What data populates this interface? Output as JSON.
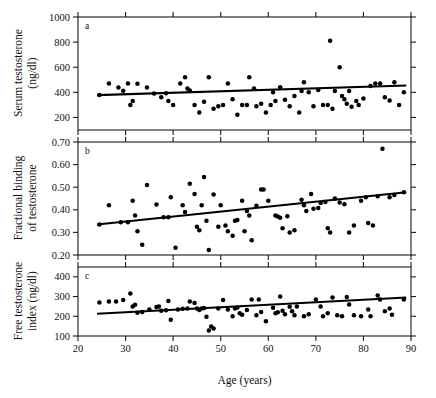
{
  "figure": {
    "xlabel": "Age (years)",
    "panel_letters": [
      "a",
      "b",
      "c"
    ]
  },
  "chart_data": [
    {
      "type": "scatter",
      "panel": "a",
      "title": "",
      "xlabel": "Age (years)",
      "ylabel": "Serum testosterone (ng/dl)",
      "ylabel_lines": [
        "Serum testosterone",
        "(ng/dl)"
      ],
      "xlim": [
        20,
        90
      ],
      "ylim": [
        100,
        1000
      ],
      "xticks": [
        20,
        30,
        40,
        50,
        60,
        70,
        80,
        90
      ],
      "xticklabels": [
        "20",
        "30",
        "40",
        "50",
        "60",
        "70",
        "80",
        "90"
      ],
      "yticks": [
        200,
        400,
        600,
        800,
        1000
      ],
      "yticklabels": [
        "200",
        "400",
        "600",
        "800",
        "1000"
      ],
      "grid": false,
      "legend": "none",
      "fit_line": {
        "x": [
          24,
          89
        ],
        "y": [
          378,
          455
        ]
      },
      "points": [
        [
          24.5,
          378
        ],
        [
          26.5,
          470
        ],
        [
          28.5,
          438
        ],
        [
          29.5,
          412
        ],
        [
          30.5,
          470
        ],
        [
          31.0,
          300
        ],
        [
          31.5,
          330
        ],
        [
          32.5,
          468
        ],
        [
          34.5,
          438
        ],
        [
          36.0,
          390
        ],
        [
          37.5,
          360
        ],
        [
          38.5,
          392
        ],
        [
          39.0,
          330
        ],
        [
          40.0,
          300
        ],
        [
          41.5,
          470
        ],
        [
          42.5,
          520
        ],
        [
          43.0,
          430
        ],
        [
          43.5,
          415
        ],
        [
          44.5,
          300
        ],
        [
          45.5,
          240
        ],
        [
          46.5,
          325
        ],
        [
          47.5,
          520
        ],
        [
          48.5,
          270
        ],
        [
          49.5,
          290
        ],
        [
          50.5,
          300
        ],
        [
          51.5,
          470
        ],
        [
          52.5,
          345
        ],
        [
          53.5,
          222
        ],
        [
          54.5,
          300
        ],
        [
          55.5,
          300
        ],
        [
          56.0,
          520
        ],
        [
          57.0,
          430
        ],
        [
          57.5,
          290
        ],
        [
          58.5,
          310
        ],
        [
          59.5,
          240
        ],
        [
          60.5,
          300
        ],
        [
          61.0,
          400
        ],
        [
          61.5,
          330
        ],
        [
          62.5,
          440
        ],
        [
          63.5,
          340
        ],
        [
          64.5,
          290
        ],
        [
          65.5,
          370
        ],
        [
          66.5,
          240
        ],
        [
          67.0,
          410
        ],
        [
          67.5,
          480
        ],
        [
          68.5,
          400
        ],
        [
          69.5,
          290
        ],
        [
          70.5,
          418
        ],
        [
          71.5,
          300
        ],
        [
          72.5,
          300
        ],
        [
          73.0,
          810
        ],
        [
          73.5,
          270
        ],
        [
          74.0,
          410
        ],
        [
          75.0,
          600
        ],
        [
          75.5,
          370
        ],
        [
          76.0,
          345
        ],
        [
          76.5,
          310
        ],
        [
          77.0,
          410
        ],
        [
          77.5,
          285
        ],
        [
          78.5,
          330
        ],
        [
          79.0,
          300
        ],
        [
          80.0,
          350
        ],
        [
          81.5,
          450
        ],
        [
          82.5,
          470
        ],
        [
          83.5,
          470
        ],
        [
          84.5,
          360
        ],
        [
          85.5,
          335
        ],
        [
          86.5,
          480
        ],
        [
          87.5,
          300
        ],
        [
          88.5,
          400
        ]
      ]
    },
    {
      "type": "scatter",
      "panel": "b",
      "title": "",
      "xlabel": "Age (years)",
      "ylabel": "Fractional binding of testosterone",
      "ylabel_lines": [
        "Fractional binding",
        "of testosterone"
      ],
      "xlim": [
        20,
        90
      ],
      "ylim": [
        0.2,
        0.7
      ],
      "xticks": [
        20,
        30,
        40,
        50,
        60,
        70,
        80,
        90
      ],
      "xticklabels": [
        "20",
        "30",
        "40",
        "50",
        "60",
        "70",
        "80",
        "90"
      ],
      "yticks": [
        0.2,
        0.3,
        0.4,
        0.5,
        0.6,
        0.7
      ],
      "yticklabels": [
        "0.20",
        "0.30",
        "0.40",
        "0.50",
        "0.60",
        "0.70"
      ],
      "grid": false,
      "legend": "none",
      "fit_line": {
        "x": [
          24,
          89
        ],
        "y": [
          0.335,
          0.478
        ]
      },
      "points": [
        [
          24.5,
          0.335
        ],
        [
          26.5,
          0.42
        ],
        [
          29.0,
          0.345
        ],
        [
          30.5,
          0.345
        ],
        [
          31.5,
          0.44
        ],
        [
          32.0,
          0.375
        ],
        [
          32.5,
          0.305
        ],
        [
          33.5,
          0.245
        ],
        [
          34.5,
          0.51
        ],
        [
          36.5,
          0.423
        ],
        [
          38.0,
          0.367
        ],
        [
          39.0,
          0.367
        ],
        [
          39.5,
          0.455
        ],
        [
          40.5,
          0.232
        ],
        [
          42.0,
          0.42
        ],
        [
          42.5,
          0.39
        ],
        [
          43.5,
          0.515
        ],
        [
          44.5,
          0.47
        ],
        [
          45.0,
          0.325
        ],
        [
          45.5,
          0.31
        ],
        [
          46.0,
          0.42
        ],
        [
          46.5,
          0.545
        ],
        [
          47.0,
          0.352
        ],
        [
          47.5,
          0.222
        ],
        [
          48.5,
          0.468
        ],
        [
          49.5,
          0.325
        ],
        [
          50.0,
          0.42
        ],
        [
          51.0,
          0.33
        ],
        [
          51.5,
          0.305
        ],
        [
          52.5,
          0.285
        ],
        [
          53.0,
          0.352
        ],
        [
          53.5,
          0.355
        ],
        [
          54.5,
          0.44
        ],
        [
          55.0,
          0.305
        ],
        [
          55.5,
          0.395
        ],
        [
          56.0,
          0.375
        ],
        [
          56.5,
          0.265
        ],
        [
          57.5,
          0.418
        ],
        [
          58.5,
          0.49
        ],
        [
          59.0,
          0.49
        ],
        [
          60.0,
          0.44
        ],
        [
          61.5,
          0.375
        ],
        [
          62.0,
          0.37
        ],
        [
          62.5,
          0.365
        ],
        [
          63.0,
          0.318
        ],
        [
          64.0,
          0.372
        ],
        [
          64.5,
          0.3
        ],
        [
          65.5,
          0.31
        ],
        [
          67.0,
          0.445
        ],
        [
          67.5,
          0.42
        ],
        [
          68.0,
          0.395
        ],
        [
          69.0,
          0.47
        ],
        [
          69.5,
          0.405
        ],
        [
          70.5,
          0.408
        ],
        [
          71.0,
          0.43
        ],
        [
          72.0,
          0.435
        ],
        [
          72.5,
          0.318
        ],
        [
          73.0,
          0.3
        ],
        [
          74.0,
          0.45
        ],
        [
          75.0,
          0.432
        ],
        [
          76.0,
          0.425
        ],
        [
          77.0,
          0.3
        ],
        [
          78.0,
          0.33
        ],
        [
          79.5,
          0.44
        ],
        [
          80.5,
          0.455
        ],
        [
          81.0,
          0.342
        ],
        [
          82.0,
          0.33
        ],
        [
          83.0,
          0.46
        ],
        [
          84.0,
          0.67
        ],
        [
          85.5,
          0.455
        ],
        [
          86.5,
          0.465
        ],
        [
          88.5,
          0.478
        ]
      ]
    },
    {
      "type": "scatter",
      "panel": "c",
      "title": "",
      "xlabel": "Age (years)",
      "ylabel": "Free testosterone index (ng/dl)",
      "ylabel_lines": [
        "Free testosterone",
        "index (ng/dl)"
      ],
      "xlim": [
        20,
        90
      ],
      "ylim": [
        100,
        450
      ],
      "xticks": [
        20,
        30,
        40,
        50,
        60,
        70,
        80,
        90
      ],
      "xticklabels": [
        "20",
        "30",
        "40",
        "50",
        "60",
        "70",
        "80",
        "90"
      ],
      "yticks": [
        100,
        200,
        300,
        400
      ],
      "yticklabels": [
        "100",
        "200",
        "300",
        "400"
      ],
      "grid": false,
      "legend": "none",
      "fit_line": {
        "x": [
          24,
          89
        ],
        "y": [
          213,
          295
        ]
      },
      "points": [
        [
          24.5,
          270
        ],
        [
          26.5,
          275
        ],
        [
          28.0,
          275
        ],
        [
          29.5,
          282
        ],
        [
          31.0,
          315
        ],
        [
          31.5,
          250
        ],
        [
          32.0,
          258
        ],
        [
          32.5,
          218
        ],
        [
          33.5,
          222
        ],
        [
          35.0,
          235
        ],
        [
          36.5,
          247
        ],
        [
          37.0,
          250
        ],
        [
          37.5,
          228
        ],
        [
          38.5,
          230
        ],
        [
          39.0,
          278
        ],
        [
          39.5,
          182
        ],
        [
          41.0,
          235
        ],
        [
          42.0,
          238
        ],
        [
          43.0,
          240
        ],
        [
          43.5,
          275
        ],
        [
          44.5,
          268
        ],
        [
          45.0,
          240
        ],
        [
          45.5,
          232
        ],
        [
          46.0,
          240
        ],
        [
          46.5,
          242
        ],
        [
          47.0,
          198
        ],
        [
          47.5,
          128
        ],
        [
          48.0,
          148
        ],
        [
          48.5,
          138
        ],
        [
          49.5,
          240
        ],
        [
          50.5,
          282
        ],
        [
          51.5,
          235
        ],
        [
          52.5,
          200
        ],
        [
          53.0,
          240
        ],
        [
          53.5,
          245
        ],
        [
          54.0,
          215
        ],
        [
          54.5,
          208
        ],
        [
          55.5,
          232
        ],
        [
          56.5,
          285
        ],
        [
          57.5,
          205
        ],
        [
          58.0,
          285
        ],
        [
          58.5,
          222
        ],
        [
          59.5,
          175
        ],
        [
          61.0,
          243
        ],
        [
          61.5,
          215
        ],
        [
          62.0,
          220
        ],
        [
          62.5,
          300
        ],
        [
          63.0,
          228
        ],
        [
          63.5,
          210
        ],
        [
          64.5,
          248
        ],
        [
          65.0,
          225
        ],
        [
          65.5,
          205
        ],
        [
          66.0,
          250
        ],
        [
          67.5,
          200
        ],
        [
          68.5,
          210
        ],
        [
          70.0,
          285
        ],
        [
          71.0,
          250
        ],
        [
          71.5,
          200
        ],
        [
          72.5,
          215
        ],
        [
          73.5,
          295
        ],
        [
          74.5,
          205
        ],
        [
          75.5,
          200
        ],
        [
          76.5,
          298
        ],
        [
          77.0,
          260
        ],
        [
          78.0,
          205
        ],
        [
          79.5,
          200
        ],
        [
          81.0,
          235
        ],
        [
          81.5,
          200
        ],
        [
          83.0,
          305
        ],
        [
          83.5,
          285
        ],
        [
          84.5,
          225
        ],
        [
          85.5,
          240
        ],
        [
          86.0,
          208
        ],
        [
          88.5,
          285
        ]
      ]
    }
  ]
}
